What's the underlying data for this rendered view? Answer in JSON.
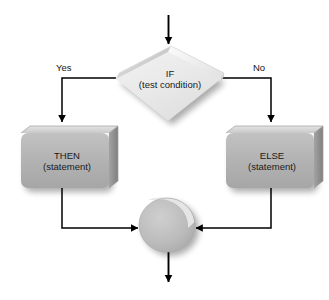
{
  "diagram": {
    "type": "flowchart",
    "background_color": "#ffffff",
    "palette": {
      "decision_fill": "#e9e9e9",
      "decision_top_face": "#f4f4f4",
      "decision_side_face": "#d2d2d2",
      "process_fill": "#b4b4b4",
      "process_top_face": "#d9d9d9",
      "process_side_face": "#8f8f8f",
      "connector_fill": "#b9b9b9",
      "connector_top_face": "#ededed",
      "line_color": "#000000",
      "text_color": "#161616"
    },
    "nodes": {
      "decision": {
        "id": "if-decision",
        "shape": "diamond",
        "line1": "IF",
        "line2": "(test condition)"
      },
      "then": {
        "id": "then-process",
        "shape": "process-box",
        "line1": "THEN",
        "line2": "(statement)"
      },
      "else": {
        "id": "else-process",
        "shape": "process-box",
        "line1": "ELSE",
        "line2": "(statement)"
      },
      "merge": {
        "id": "merge-connector",
        "shape": "circle-connector",
        "line1": "",
        "line2": ""
      }
    },
    "edges": [
      {
        "id": "entry",
        "from": "entry-point",
        "to": "if-decision",
        "label": ""
      },
      {
        "id": "yes-branch",
        "from": "if-decision",
        "to": "then-process",
        "label": "Yes"
      },
      {
        "id": "no-branch",
        "from": "if-decision",
        "to": "else-process",
        "label": "No"
      },
      {
        "id": "then-to-merge",
        "from": "then-process",
        "to": "merge-connector",
        "label": ""
      },
      {
        "id": "else-to-merge",
        "from": "else-process",
        "to": "merge-connector",
        "label": ""
      },
      {
        "id": "exit",
        "from": "merge-connector",
        "to": "exit-point",
        "label": ""
      }
    ]
  }
}
